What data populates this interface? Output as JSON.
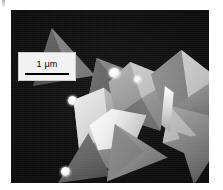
{
  "figure": {
    "type": "sem-micrograph",
    "modality": "scanning electron microscopy",
    "background_color": "#0b0b0b",
    "frame": {
      "x": 11,
      "y": 10,
      "width": 198,
      "height": 173
    }
  },
  "scale_bar": {
    "label": "1 μm",
    "length_value": 1,
    "length_unit": "μm",
    "box_color": "#f2f2f2",
    "line_color": "#000000",
    "position": "top-left"
  },
  "content": {
    "description": "Dark-field SEM image of faceted tetrahedral crystals with bright spherical nanoparticles attached at vertices",
    "particle_count": 11,
    "sphere_count": 4
  },
  "particles": [
    {
      "name": "triangle-upper-left-a",
      "shade": "#4a4a4a"
    },
    {
      "name": "triangle-upper-left-b",
      "shade": "#6e6e6e"
    },
    {
      "name": "tetrahedron-center-left",
      "shade": "#8e8e8e"
    },
    {
      "name": "tetrahedron-center",
      "shade": "#a6a6a6"
    },
    {
      "name": "tetrahedron-center-bright",
      "shade": "#e6e6e6"
    },
    {
      "name": "tetrahedron-upper-right",
      "shade": "#9d9d9d"
    },
    {
      "name": "tetrahedron-right",
      "shade": "#7d7d7d"
    },
    {
      "name": "tetrahedron-lower-right",
      "shade": "#707070"
    },
    {
      "name": "triangle-bottom-center",
      "shade": "#7a7a7a"
    },
    {
      "name": "triangle-bottom-left",
      "shade": "#5c5c5c"
    },
    {
      "name": "triangle-bottom-right",
      "shade": "#6a6a6a"
    }
  ],
  "spheres": [
    {
      "name": "sphere-top-center"
    },
    {
      "name": "sphere-mid-right"
    },
    {
      "name": "sphere-mid-left"
    },
    {
      "name": "sphere-bottom-left"
    }
  ],
  "colors": {
    "background": "#0b0b0b",
    "page": "#ffffff",
    "scalebar_box": "#f2f2f2",
    "scalebar_line": "#000000",
    "highlight": "#ffffff"
  }
}
